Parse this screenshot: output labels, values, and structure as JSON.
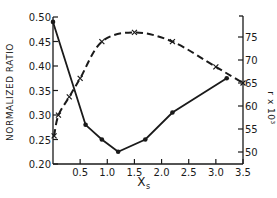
{
  "chart_data": {
    "type": "line",
    "title": "",
    "xlabel": "X_s",
    "ylabel": "NORMALIZED RATIO",
    "y2label": "r x 10^3",
    "xlim": [
      0,
      3.5
    ],
    "ylim": [
      0.2,
      0.5
    ],
    "y2lim": [
      48,
      80
    ],
    "x_ticks": [
      "0.5",
      "1.0",
      "1.5",
      "2.0",
      "2.5",
      "3.0",
      "3.5"
    ],
    "y_ticks": [
      "0.20",
      "0.25",
      "0.30",
      "0.35",
      "0.40",
      "0.45",
      "0.50"
    ],
    "y2_ticks": [
      "50",
      "55",
      "60",
      "65",
      "70",
      "75"
    ],
    "series": [
      {
        "name": "Normalized ratio",
        "style": "solid",
        "axis": "left",
        "x": [
          0.0,
          0.6,
          0.9,
          1.2,
          1.7,
          2.2,
          3.2
        ],
        "values": [
          0.49,
          0.28,
          0.25,
          0.225,
          0.25,
          0.305,
          0.375
        ]
      },
      {
        "name": "r x 10^3",
        "style": "dashed",
        "axis": "right",
        "x": [
          0.02,
          0.1,
          0.3,
          0.5,
          0.9,
          1.5,
          2.2,
          3.0,
          3.5
        ],
        "values": [
          53.5,
          58,
          62,
          66,
          74,
          76,
          74,
          68.5,
          65
        ]
      }
    ],
    "grid": false,
    "legend": "none"
  },
  "labels": {
    "ylabel": "NORMALIZED RATIO",
    "xlabel_main": "X",
    "xlabel_sub": "s",
    "y2label": "r x 10³"
  }
}
